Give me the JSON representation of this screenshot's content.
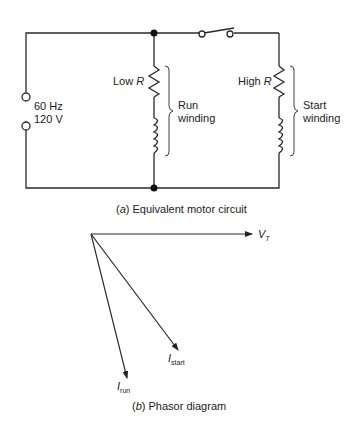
{
  "figure": {
    "circuit": {
      "source": {
        "frequency": "60 Hz",
        "voltage": "120 V"
      },
      "run_branch": {
        "resistor_label_prefix": "Low ",
        "resistor_label_symbol": "R",
        "winding_label_line1": "Run",
        "winding_label_line2": "winding"
      },
      "start_branch": {
        "resistor_label_prefix": "High ",
        "resistor_label_symbol": "R",
        "winding_label_line1": "Start",
        "winding_label_line2": "winding"
      },
      "caption_letter": "a",
      "caption_text": "Equivalent motor circuit"
    },
    "phasor": {
      "vt_main": "V",
      "vt_sub": "T",
      "irun_main": "I",
      "irun_sub": "run",
      "istart_main": "I",
      "istart_sub": "start",
      "caption_letter": "b",
      "caption_text": "Phasor diagram"
    }
  },
  "colors": {
    "line": "#2a2a2a",
    "text": "#222222",
    "background": "#ffffff"
  }
}
